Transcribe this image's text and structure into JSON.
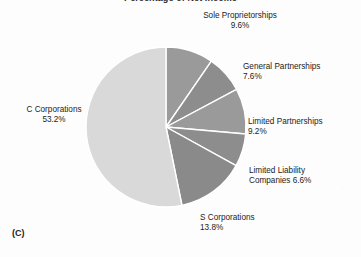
{
  "figure": {
    "letter": "(C)",
    "title": "Percentage of Net Income"
  },
  "chart_data": {
    "type": "pie",
    "title": "Percentage of Net Income",
    "xlabel": "",
    "ylabel": "",
    "units": "percent",
    "start_angle_deg": 0,
    "direction": "clockwise",
    "total": 100.0,
    "categories": [
      "Sole Proprietorships",
      "General Partnerships",
      "Limited Partnerships",
      "Limited Liability Companies",
      "S Corporations",
      "C Corporations"
    ],
    "values": [
      9.6,
      7.6,
      9.2,
      6.6,
      13.8,
      53.2
    ],
    "slices": [
      {
        "label": "Sole Proprietorships",
        "value": 9.6,
        "value_text": "9.6%",
        "color": "#9a9a9a"
      },
      {
        "label": "General Partnerships",
        "value": 7.6,
        "value_text": "7.6%",
        "color": "#8d8d8d"
      },
      {
        "label": "Limited Partnerships",
        "value": 9.2,
        "value_text": "9.2%",
        "color": "#9a9a9a"
      },
      {
        "label": "Limited Liability Companies",
        "value": 6.6,
        "value_text": "6.6%",
        "color": "#8d8d8d"
      },
      {
        "label": "S Corporations",
        "value": 13.8,
        "value_text": "13.8%",
        "color": "#8a8a8a"
      },
      {
        "label": "C Corporations",
        "value": 53.2,
        "value_text": "53.2%",
        "color": "#d9d9d9"
      }
    ],
    "legend_position": "outside-labels",
    "grid": false,
    "slice_border_color": "#ffffff",
    "background_color": "#fdfdfd"
  },
  "labels": {
    "sole": {
      "name": "Sole Proprietorships",
      "pct": "9.6%"
    },
    "general": {
      "name": "General Partnerships",
      "pct": "7.6%"
    },
    "limited_partnerships": {
      "name": "Limited Partnerships",
      "pct": "9.2%"
    },
    "limited_liability": {
      "name": "Limited Liability",
      "pct": "Companies 6.6%"
    },
    "s_corporations": {
      "name": "S Corporations",
      "pct": "13.8%"
    },
    "c_corporations": {
      "name": "C Corporations",
      "pct": "53.2%"
    }
  }
}
